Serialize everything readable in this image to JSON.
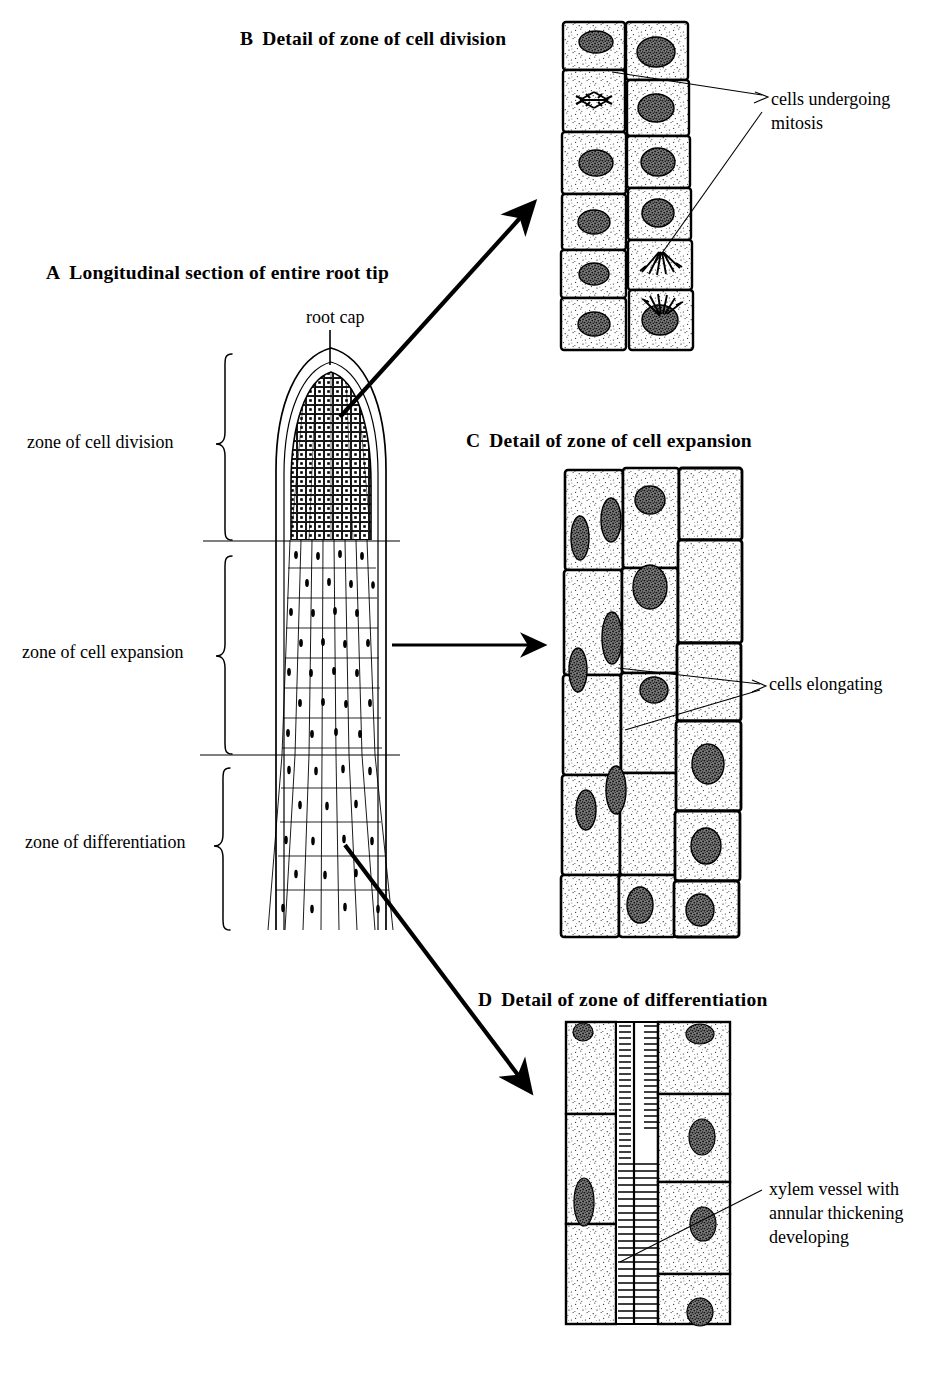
{
  "figure": {
    "kind": "botanical-diagram"
  },
  "panels": [
    {
      "id": "A",
      "letter": "A",
      "title": "Longitudinal section of entire root tip",
      "callouts": [
        {
          "name": "root-cap",
          "text": "root cap"
        }
      ],
      "zones": [
        {
          "name": "zone-of-cell-division",
          "text": "zone of cell division"
        },
        {
          "name": "zone-of-cell-expansion",
          "text": "zone of cell expansion"
        },
        {
          "name": "zone-of-differentiation",
          "text": "zone of differentiation"
        }
      ]
    },
    {
      "id": "B",
      "letter": "B",
      "title": "Detail of zone of cell division",
      "callouts": [
        {
          "name": "cells-undergoing-mitosis",
          "line1": "cells undergoing",
          "line2": "mitosis"
        }
      ]
    },
    {
      "id": "C",
      "letter": "C",
      "title": "Detail of zone of cell expansion",
      "callouts": [
        {
          "name": "cells-elongating",
          "line1": "cells elongating"
        }
      ]
    },
    {
      "id": "D",
      "letter": "D",
      "title": "Detail of zone of differentiation",
      "callouts": [
        {
          "name": "xylem-vessel",
          "line1": "xylem vessel with",
          "line2": "annular thickening",
          "line3": "developing"
        }
      ]
    }
  ],
  "colors": {
    "ink": "#000000",
    "paper": "#ffffff",
    "nucleus": "#4a4a4a",
    "cytoplasm_stipple": "#2b2b2b"
  }
}
